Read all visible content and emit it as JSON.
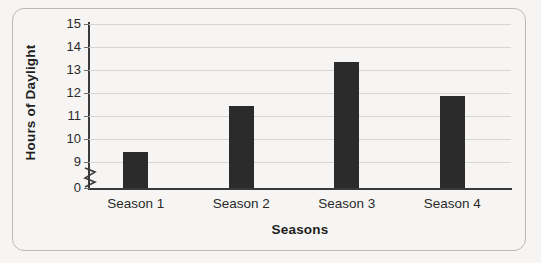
{
  "figure": {
    "background_color": "#f6f5f3",
    "frame_color": "#b9b9b7",
    "bar_color": "#2b2b2b",
    "grid_color": "#d6d6d4",
    "axis_color": "#3a3a3a"
  },
  "axis_titles": {
    "y": "Hours of Daylight",
    "x": "Seasons"
  },
  "y_ticks": [
    {
      "label": "15",
      "value": 15
    },
    {
      "label": "14",
      "value": 14
    },
    {
      "label": "13",
      "value": 13
    },
    {
      "label": "12",
      "value": 12
    },
    {
      "label": "11",
      "value": 11
    },
    {
      "label": "10",
      "value": 10
    },
    {
      "label": "9",
      "value": 9
    },
    {
      "label": "0",
      "value": 0
    }
  ],
  "axis_break": {
    "present": true,
    "symbol": "zigzag",
    "between": [
      0,
      9
    ]
  },
  "chart_data": {
    "type": "bar",
    "title": "",
    "xlabel": "Seasons",
    "ylabel": "Hours of Daylight",
    "categories": [
      "Season 1",
      "Season 2",
      "Season 3",
      "Season 4"
    ],
    "values": [
      9.45,
      11.45,
      13.35,
      11.85
    ],
    "ylim": [
      9,
      15
    ],
    "y_axis_break": true,
    "y_tick_labels": [
      "0",
      "9",
      "10",
      "11",
      "12",
      "13",
      "14",
      "15"
    ],
    "grid": true,
    "grid_axis": "y",
    "legend": false,
    "series": [
      {
        "name": "Hours of Daylight",
        "color": "#2b2b2b",
        "values": [
          9.45,
          11.45,
          13.35,
          11.85
        ]
      }
    ]
  }
}
